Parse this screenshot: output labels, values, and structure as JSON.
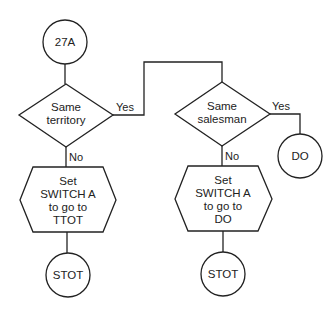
{
  "diagram": {
    "type": "flowchart",
    "nodes": {
      "start": {
        "shape": "circle",
        "label": "27A"
      },
      "decision1": {
        "shape": "diamond",
        "line1": "Same",
        "line2": "territory"
      },
      "decision2": {
        "shape": "diamond",
        "line1": "Same",
        "line2": "salesman"
      },
      "do_end": {
        "shape": "circle",
        "label": "DO"
      },
      "process1": {
        "shape": "hexagon",
        "line1": "Set",
        "line2": "SWITCH A",
        "line3": "to go to",
        "line4": "TTOT"
      },
      "process2": {
        "shape": "hexagon",
        "line1": "Set",
        "line2": "SWITCH A",
        "line3": "to go to",
        "line4": "DO"
      },
      "stot1": {
        "shape": "circle",
        "label": "STOT"
      },
      "stot2": {
        "shape": "circle",
        "label": "STOT"
      }
    },
    "edge_labels": {
      "d1_yes": "Yes",
      "d1_no": "No",
      "d2_yes": "Yes",
      "d2_no": "No"
    },
    "edges": [
      {
        "from": "27A",
        "to": "Same territory"
      },
      {
        "from": "Same territory",
        "to": "Same salesman",
        "label": "Yes"
      },
      {
        "from": "Same territory",
        "to": "Set SWITCH A to go to TTOT",
        "label": "No"
      },
      {
        "from": "Set SWITCH A to go to TTOT",
        "to": "STOT"
      },
      {
        "from": "Same salesman",
        "to": "DO",
        "label": "Yes"
      },
      {
        "from": "Same salesman",
        "to": "Set SWITCH A to go to DO",
        "label": "No"
      },
      {
        "from": "Set SWITCH A to go to DO",
        "to": "STOT"
      }
    ]
  }
}
